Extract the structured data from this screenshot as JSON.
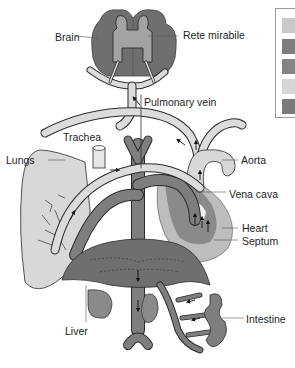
{
  "labels": {
    "brain": "Brain",
    "rete_mirabile": "Rete mirabile",
    "pulmonary_vein": "Pulmonary vein",
    "trachea": "Trachea",
    "lungs": "Lungs",
    "aorta": "Aorta",
    "vena_cava": "Vena cava",
    "heart": "Heart",
    "septum": "Septum",
    "liver": "Liver",
    "intestine": "Intestine"
  },
  "legend": {
    "swatches": [
      {
        "color": "#c9c9c9"
      },
      {
        "color": "#7d7d7d"
      },
      {
        "color": "#858585"
      },
      {
        "color": "#d6d6d6"
      },
      {
        "color": "#7a7a7a"
      }
    ]
  },
  "colors": {
    "oxygenated": "#dcdcdc",
    "deoxygenated": "#7e7e7e",
    "organ_dark": "#6f6f6f",
    "organ_light": "#bfbfbf",
    "lung": "#d8d8d8",
    "outline": "#2a2a2a"
  }
}
